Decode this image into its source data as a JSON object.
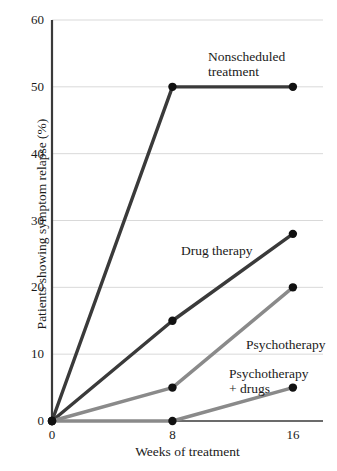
{
  "chart_data": {
    "type": "line",
    "title": "",
    "xlabel": "Weeks of treatment",
    "ylabel": "Patients showing symptom relapse (%)",
    "x": [
      0,
      8,
      16
    ],
    "xtick_labels": [
      "0",
      "8",
      "16"
    ],
    "ytick_labels": [
      "0",
      "10",
      "20",
      "30",
      "40",
      "50",
      "60"
    ],
    "xlim": [
      0,
      18
    ],
    "ylim": [
      0,
      60
    ],
    "grid": "horizontal",
    "legend": "inline-annotations",
    "series": [
      {
        "name": "Nonscheduled treatment",
        "label_line1": "Nonscheduled",
        "label_line2": "treatment",
        "values": [
          0,
          50,
          50
        ],
        "color": "#3a3a3a"
      },
      {
        "name": "Drug therapy",
        "label_line1": "Drug therapy",
        "label_line2": "",
        "values": [
          0,
          15,
          28
        ],
        "color": "#3a3a3a"
      },
      {
        "name": "Psychotherapy",
        "label_line1": "Psychotherapy",
        "label_line2": "",
        "values": [
          0,
          5,
          20
        ],
        "color": "#8a8a8a"
      },
      {
        "name": "Psychotherapy + drugs",
        "label_line1": "Psychotherapy",
        "label_line2": "+ drugs",
        "values": [
          0,
          0,
          5
        ],
        "color": "#8a8a8a"
      }
    ],
    "colors": {
      "axis": "#3a3a3a",
      "grid": "#d9d9d9",
      "marker": "#111111",
      "text": "#1a1a1a"
    }
  }
}
